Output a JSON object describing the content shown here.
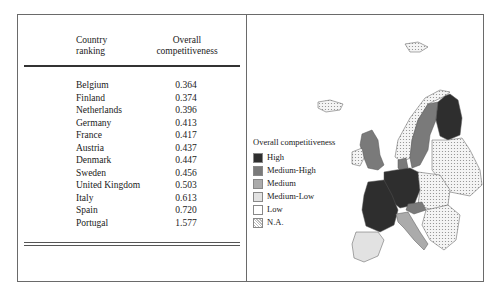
{
  "table": {
    "headers": {
      "country": "Country\nranking",
      "country_l1": "Country",
      "country_l2": "ranking",
      "value_l1": "Overall",
      "value_l2": "competitiveness"
    },
    "rows": [
      {
        "country": "Belgium",
        "value": "0.364"
      },
      {
        "country": "Finland",
        "value": "0.374"
      },
      {
        "country": "Netherlands",
        "value": "0.396"
      },
      {
        "country": "Germany",
        "value": "0.413"
      },
      {
        "country": "France",
        "value": "0.417"
      },
      {
        "country": "Austria",
        "value": "0.437"
      },
      {
        "country": "Denmark",
        "value": "0.447"
      },
      {
        "country": "Sweden",
        "value": "0.456"
      },
      {
        "country": "United Kingdom",
        "value": "0.503"
      },
      {
        "country": "Italy",
        "value": "0.613"
      },
      {
        "country": "Spain",
        "value": "0.720"
      },
      {
        "country": "Portugal",
        "value": "1.577"
      }
    ]
  },
  "legend": {
    "title": "Overall competitiveness",
    "items": [
      {
        "label": "High",
        "color": "#2e2e2e"
      },
      {
        "label": "Medium-High",
        "color": "#7a7a7a"
      },
      {
        "label": "Medium",
        "color": "#ababab"
      },
      {
        "label": "Medium-Low",
        "color": "#e2e2e2"
      },
      {
        "label": "Low",
        "color": "#ffffff"
      },
      {
        "label": "N.A.",
        "color": "dotted"
      }
    ]
  },
  "map": {
    "title": "Europe map of overall competitiveness",
    "classes": {
      "High": [
        "Belgium",
        "Finland",
        "Netherlands",
        "Germany",
        "France"
      ],
      "Medium-High": [
        "Austria",
        "Denmark",
        "Sweden",
        "United Kingdom"
      ],
      "Medium": [
        "Italy"
      ],
      "Medium-Low": [
        "Spain",
        "Portugal"
      ]
    }
  }
}
